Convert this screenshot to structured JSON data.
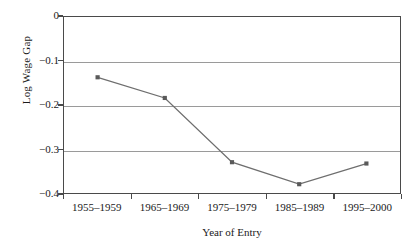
{
  "chart_data": {
    "type": "line",
    "title": "",
    "xlabel": "Year of Entry",
    "ylabel": "Log Wage Gap",
    "categories": [
      "1955–1959",
      "1965–1969",
      "1975–1979",
      "1985–1989",
      "1995–2000"
    ],
    "values": [
      -0.137,
      -0.184,
      -0.33,
      -0.38,
      -0.333
    ],
    "series": [
      {
        "name": "Log Wage Gap",
        "values": [
          -0.137,
          -0.184,
          -0.33,
          -0.38,
          -0.333
        ]
      }
    ],
    "ylim": [
      -0.4,
      0
    ],
    "ytick_labels": [
      "0",
      "−0.1",
      "−0.2",
      "−0.3",
      "−0.4"
    ],
    "ytick_values": [
      0,
      -0.1,
      -0.2,
      -0.3,
      -0.4
    ],
    "grid": "horizontal",
    "legend": "none",
    "marker": "square",
    "line_color": "#6e6e6e",
    "marker_color": "#5a5a5a",
    "grid_color": "#9a9a9a",
    "axis_color": "#4a4a4a"
  },
  "axes": {
    "y_title": "Log Wage Gap",
    "x_title": "Year of Entry"
  }
}
